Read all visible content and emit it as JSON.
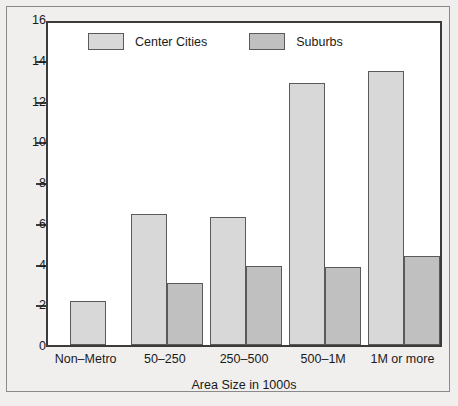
{
  "chart_data": {
    "type": "bar",
    "title": "",
    "subtitle": "",
    "xlabel": "Area Size in 1000s",
    "ylabel": "",
    "categories": [
      "Non–Metro",
      "50–250",
      "250–500",
      "500–1M",
      "1M or more"
    ],
    "series": [
      {
        "name": "Center Cities",
        "color": "#d8d8d8",
        "values": [
          2.15,
          6.45,
          6.3,
          12.85,
          13.45
        ]
      },
      {
        "name": "Suburbs",
        "color": "#c0c0c0",
        "values": [
          null,
          3.05,
          3.9,
          3.85,
          4.35
        ]
      }
    ],
    "ylim": [
      0,
      16
    ],
    "yticks": [
      0,
      2,
      4,
      6,
      8,
      10,
      12,
      14,
      16
    ],
    "ytick_labels": [
      "0",
      "2",
      "4",
      "6",
      "8",
      "10",
      "12",
      "14",
      "16"
    ],
    "grid": false,
    "legend_position": "top-inside",
    "bar_edge_color": "#5a5a5a",
    "axis_color": "#3b3b3b",
    "plot_background": "#ffffff",
    "figure_background": "#f0efed"
  },
  "legend": {
    "entries": [
      {
        "label": "Center Cities"
      },
      {
        "label": "Suburbs"
      }
    ]
  }
}
